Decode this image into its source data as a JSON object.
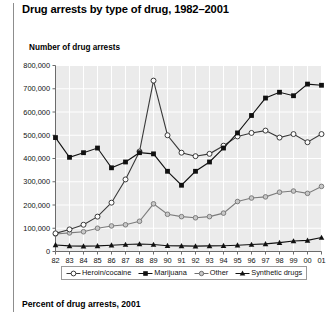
{
  "header": {
    "title": "Drug arrests by type of drug, 1982–2001"
  },
  "footer": {
    "title": "Percent of drug arrests, 2001"
  },
  "axis": {
    "y_label": "Number of drug arrests",
    "y_ticks": [
      "800,000",
      "700,000",
      "600,000",
      "500,000",
      "400,000",
      "300,000",
      "200,000",
      "100,000",
      "0"
    ],
    "x_ticks": [
      "82",
      "83",
      "84",
      "85",
      "86",
      "87",
      "88",
      "89",
      "90",
      "91",
      "92",
      "93",
      "94",
      "95",
      "96",
      "97",
      "98",
      "99",
      "00",
      "01"
    ]
  },
  "legend": {
    "items": [
      {
        "label": "Heroin/cocaine",
        "marker": "open-circle",
        "color": "#3a3a3a"
      },
      {
        "label": "Marijuana",
        "marker": "filled-square",
        "color": "#111111"
      },
      {
        "label": "Other",
        "marker": "small-open-circle",
        "color": "#6e6e6e"
      },
      {
        "label": "Synthetic drugs",
        "marker": "filled-triangle",
        "color": "#111111"
      }
    ]
  },
  "colors": {
    "plot_background": "#ebebeb",
    "gridline": "#ffffff",
    "axis": "#6b6b6b",
    "heroin_cocaine": "#3a3a3a",
    "marijuana": "#111111",
    "other": "#7c7c7c",
    "synthetic": "#111111",
    "page_background": "#ffffff"
  },
  "chart_data": {
    "type": "line",
    "title": "Drug arrests by type of drug, 1982–2001",
    "xlabel": "",
    "ylabel": "Number of drug arrests",
    "ylim": [
      0,
      800000
    ],
    "ytick_step": 100000,
    "grid": true,
    "legend_position": "bottom",
    "categories": [
      "82",
      "83",
      "84",
      "85",
      "86",
      "87",
      "88",
      "89",
      "90",
      "91",
      "92",
      "93",
      "94",
      "95",
      "96",
      "97",
      "98",
      "99",
      "00",
      "01"
    ],
    "x": [
      1982,
      1983,
      1984,
      1985,
      1986,
      1987,
      1988,
      1989,
      1990,
      1991,
      1992,
      1993,
      1994,
      1995,
      1996,
      1997,
      1998,
      1999,
      2000,
      2001
    ],
    "series": [
      {
        "name": "Heroin/cocaine",
        "marker": "open-circle",
        "color": "#3a3a3a",
        "values": [
          78000,
          95000,
          115000,
          150000,
          210000,
          310000,
          430000,
          735000,
          500000,
          425000,
          410000,
          420000,
          455000,
          495000,
          510000,
          520000,
          490000,
          505000,
          470000,
          505000
        ]
      },
      {
        "name": "Marijuana",
        "marker": "filled-square",
        "color": "#111111",
        "values": [
          490000,
          405000,
          425000,
          445000,
          360000,
          385000,
          425000,
          420000,
          345000,
          285000,
          345000,
          385000,
          445000,
          510000,
          585000,
          660000,
          685000,
          670000,
          720000,
          715000
        ]
      },
      {
        "name": "Other",
        "marker": "small-open-circle",
        "color": "#7c7c7c",
        "values": [
          75000,
          80000,
          85000,
          100000,
          110000,
          115000,
          130000,
          205000,
          160000,
          150000,
          145000,
          150000,
          165000,
          215000,
          230000,
          235000,
          255000,
          260000,
          250000,
          280000
        ]
      },
      {
        "name": "Synthetic drugs",
        "marker": "filled-triangle",
        "color": "#111111",
        "values": [
          28000,
          24000,
          23000,
          24000,
          27000,
          30000,
          32000,
          30000,
          25000,
          24000,
          23000,
          24000,
          25000,
          27000,
          30000,
          33000,
          38000,
          45000,
          48000,
          60000
        ]
      }
    ]
  }
}
